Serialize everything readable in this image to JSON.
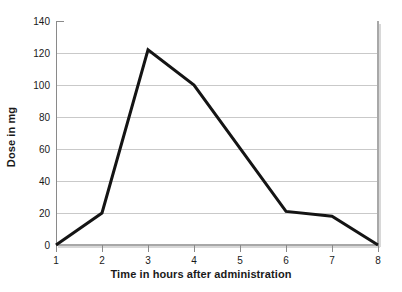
{
  "chart_data": {
    "type": "line",
    "title": "",
    "xlabel": "Time in hours after administration",
    "ylabel": "Dose in mg",
    "x": [
      1,
      2,
      3,
      4,
      6,
      7,
      8
    ],
    "values": [
      0,
      20,
      122,
      100,
      21,
      18,
      0
    ],
    "series": [
      {
        "name": "Dose",
        "x": [
          1,
          2,
          3,
          4,
          6,
          7,
          8
        ],
        "values": [
          0,
          20,
          122,
          100,
          21,
          18,
          0
        ],
        "color": "#141414"
      }
    ],
    "xlim": [
      1,
      8
    ],
    "ylim": [
      0,
      140
    ],
    "xticks": [
      1,
      2,
      3,
      4,
      5,
      6,
      7,
      8
    ],
    "yticks": [
      0,
      20,
      40,
      60,
      80,
      100,
      120,
      140
    ],
    "xtick_labels": [
      "1",
      "2",
      "3",
      "4",
      "5",
      "6",
      "7",
      "8"
    ],
    "ytick_labels": [
      "0",
      "20",
      "40",
      "60",
      "80",
      "100",
      "120",
      "140"
    ],
    "grid": "horizontal",
    "gridline_values": [
      20,
      40,
      60,
      80,
      100,
      120
    ],
    "legend": null,
    "legend_position": "none",
    "annotations": [],
    "colors": {
      "background": "#ffffff",
      "line": "#141414",
      "gridline": "#c9c9c9",
      "axis": "#a8a8a8",
      "text": "#1a1a1a"
    }
  },
  "axes": {
    "y_title": "Dose in mg",
    "x_title": "Time in hours after administration"
  },
  "ticks": {
    "y": [
      {
        "label": "140"
      },
      {
        "label": "120"
      },
      {
        "label": "100"
      },
      {
        "label": "80"
      },
      {
        "label": "60"
      },
      {
        "label": "40"
      },
      {
        "label": "20"
      },
      {
        "label": "0"
      }
    ],
    "x": [
      {
        "label": "1"
      },
      {
        "label": "2"
      },
      {
        "label": "3"
      },
      {
        "label": "4"
      },
      {
        "label": "5"
      },
      {
        "label": "6"
      },
      {
        "label": "7"
      },
      {
        "label": "8"
      }
    ]
  }
}
